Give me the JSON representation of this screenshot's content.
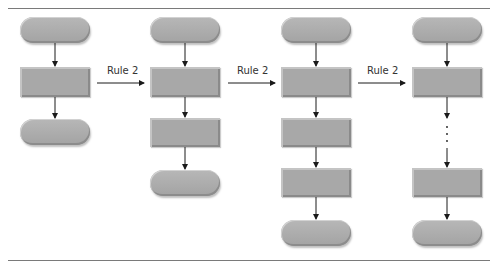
{
  "diagram": {
    "type": "flowchart-rule-application",
    "transition_labels": [
      "Rule 2",
      "Rule 2",
      "Rule 2"
    ],
    "colors": {
      "shape_fill": "#a9a9a9",
      "arrow": "#1a1a1a",
      "rule_line": "#7a7a7a",
      "label_text": "#333333"
    },
    "columns": [
      {
        "shapes": [
          "oval",
          "rect",
          "oval"
        ]
      },
      {
        "shapes": [
          "oval",
          "rect",
          "rect",
          "oval"
        ]
      },
      {
        "shapes": [
          "oval",
          "rect",
          "rect",
          "rect",
          "oval"
        ]
      },
      {
        "shapes": [
          "oval",
          "rect",
          "ellipsis",
          "rect",
          "oval"
        ]
      }
    ]
  }
}
